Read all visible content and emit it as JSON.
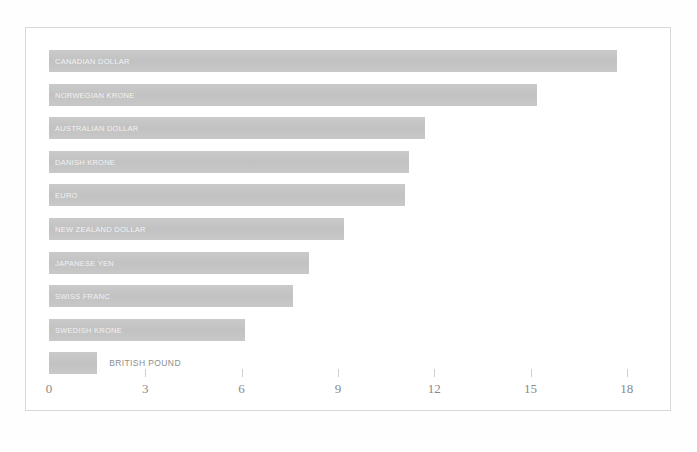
{
  "chart_data": {
    "type": "bar",
    "orientation": "horizontal",
    "title": "",
    "subtitle": "",
    "xlabel": "",
    "ylabel": "",
    "xlim": [
      0,
      18
    ],
    "xticks": [
      0,
      3,
      6,
      9,
      12,
      15,
      18
    ],
    "xtick_labels": [
      "0",
      "3",
      "6",
      "9",
      "12",
      "15",
      "18"
    ],
    "grid": false,
    "legend": "none",
    "bar_color": "#c6c6c6",
    "inside_label_color": "#f2f2f2",
    "outside_label_color": "#8d8d8d",
    "axis_text_color": "#8a8a8a",
    "frame_color": "#d8d8d8",
    "categories": [
      "CANADIAN DOLLAR",
      "NORWEGIAN KRONE",
      "AUSTRALIAN DOLLAR",
      "DANISH KRONE",
      "EURO",
      "NEW ZEALAND DOLLAR",
      "JAPANESE YEN",
      "SWISS FRANC",
      "SWEDISH KRONE",
      "BRITISH POUND"
    ],
    "values": [
      17.7,
      15.2,
      11.7,
      11.2,
      11.1,
      9.2,
      8.1,
      7.6,
      6.1,
      1.5
    ],
    "bars": [
      {
        "label": "CANADIAN DOLLAR",
        "value": 17.7,
        "label_position": "inside"
      },
      {
        "label": "NORWEGIAN KRONE",
        "value": 15.2,
        "label_position": "inside"
      },
      {
        "label": "AUSTRALIAN DOLLAR",
        "value": 11.7,
        "label_position": "inside"
      },
      {
        "label": "DANISH KRONE",
        "value": 11.2,
        "label_position": "inside"
      },
      {
        "label": "EURO",
        "value": 11.1,
        "label_position": "inside"
      },
      {
        "label": "NEW ZEALAND DOLLAR",
        "value": 9.2,
        "label_position": "inside"
      },
      {
        "label": "JAPANESE YEN",
        "value": 8.1,
        "label_position": "inside"
      },
      {
        "label": "SWISS FRANC",
        "value": 7.6,
        "label_position": "inside"
      },
      {
        "label": "SWEDISH KRONE",
        "value": 6.1,
        "label_position": "inside"
      },
      {
        "label": "BRITISH POUND",
        "value": 1.5,
        "label_position": "outside"
      }
    ]
  },
  "caption": ""
}
